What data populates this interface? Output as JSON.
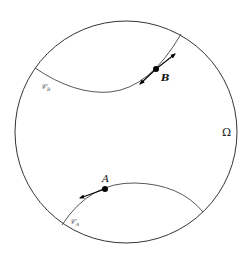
{
  "diagram": {
    "region_label": "Ω",
    "curves": [
      {
        "name": "C_B",
        "label_main": "𝒞",
        "label_sub": "B"
      },
      {
        "name": "C_A",
        "label_main": "𝒞",
        "label_sub": "A"
      }
    ],
    "points": [
      {
        "name": "B",
        "label": "B"
      },
      {
        "name": "A",
        "label": "A"
      }
    ],
    "colors": {
      "stroke": "#333333",
      "point": "#000000"
    }
  }
}
